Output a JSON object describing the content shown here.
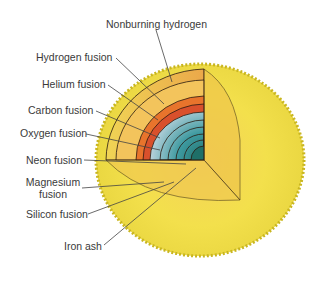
{
  "diagram": {
    "labels": [
      {
        "id": "nonburning-hydrogen",
        "text": "Nonburning hydrogen"
      },
      {
        "id": "hydrogen-fusion",
        "text": "Hydrogen fusion"
      },
      {
        "id": "helium-fusion",
        "text": "Helium fusion"
      },
      {
        "id": "carbon-fusion",
        "text": "Carbon fusion"
      },
      {
        "id": "oxygen-fusion",
        "text": "Oxygen fusion"
      },
      {
        "id": "neon-fusion",
        "text": "Neon fusion"
      },
      {
        "id": "magnesium-fusion",
        "text": "Magnesium\nfusion",
        "line1": "Magnesium",
        "line2": "fusion"
      },
      {
        "id": "silicon-fusion",
        "text": "Silicon fusion"
      },
      {
        "id": "iron-ash",
        "text": "Iron ash"
      }
    ],
    "colors": {
      "outer_envelope": "#f2e24a",
      "envelope_inner": "#f0c84a",
      "hydrogen_shell": "#efc060",
      "helium_shell": "#e86a2a",
      "carbon_shell": "#d9442a",
      "oxygen_shell": "#b7ccd8",
      "neon_shell": "#8fb8c8",
      "core_teal": "#2e8a8a",
      "outline": "#2a1a10"
    }
  }
}
